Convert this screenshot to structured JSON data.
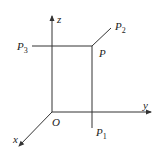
{
  "diagram": {
    "type": "3d-coordinate-projection",
    "axes": {
      "x": {
        "label": "x"
      },
      "y": {
        "label": "y"
      },
      "z": {
        "label": "z"
      }
    },
    "origin": {
      "label": "O"
    },
    "points": {
      "P": {
        "label": "P",
        "sub": ""
      },
      "P1": {
        "label": "P",
        "sub": "1"
      },
      "P2": {
        "label": "P",
        "sub": "2"
      },
      "P3": {
        "label": "P",
        "sub": "3"
      }
    },
    "colors": {
      "line": "#333333",
      "text": "#222222",
      "background": "#ffffff"
    }
  }
}
